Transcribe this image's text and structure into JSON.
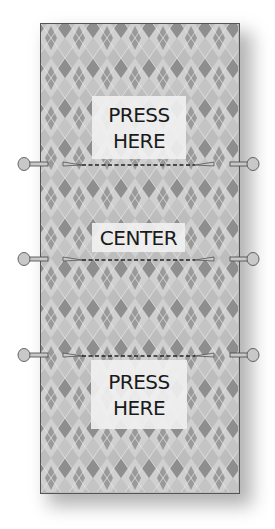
{
  "diagram": {
    "labels": {
      "top": {
        "line1": "PRESS",
        "line2": "HERE"
      },
      "center": {
        "text": "CENTER"
      },
      "bottom": {
        "line1": "PRESS",
        "line2": "HERE"
      }
    },
    "pin_lines": [
      {
        "name": "upper-fold-line",
        "y": 164
      },
      {
        "name": "center-fold-line",
        "y": 259
      },
      {
        "name": "lower-fold-line",
        "y": 355
      }
    ],
    "colors": {
      "fabric_base": "#bdbdbd",
      "diamond_dark": "#8e8e8e",
      "diamond_light": "#cfcfcf",
      "label_bg": "#f0f0f0",
      "text": "#1a1a1a",
      "pin_head": "#c8c8c8",
      "outline": "#555555"
    }
  }
}
